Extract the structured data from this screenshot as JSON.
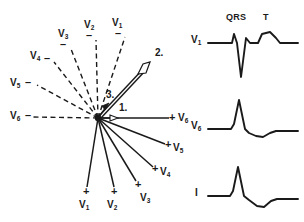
{
  "figure": {
    "stroke_color": "#1a1a1a",
    "background": "#ffffff"
  },
  "vector_diagram": {
    "origin": {
      "x": 98,
      "y": 118
    },
    "negative_axes": [
      {
        "lead": "V",
        "index": "1",
        "sign": "–",
        "label_x": 118,
        "label_y": 22,
        "sign_x": 120,
        "sign_y": 33,
        "end_x": 124,
        "end_y": 38
      },
      {
        "lead": "V",
        "index": "2",
        "sign": "–",
        "label_x": 89,
        "label_y": 24,
        "sign_x": 91,
        "sign_y": 35,
        "end_x": 95,
        "end_y": 41
      },
      {
        "lead": "V",
        "index": "3",
        "sign": "–",
        "label_x": 62,
        "label_y": 33,
        "sign_x": 64,
        "sign_y": 44,
        "end_x": 71,
        "end_y": 50
      },
      {
        "lead": "V",
        "index": "4",
        "sign": "–",
        "label_x": 33,
        "label_y": 55,
        "sign_x": 48,
        "sign_y": 58,
        "end_x": 55,
        "end_y": 63
      },
      {
        "lead": "V",
        "index": "5",
        "sign": "–",
        "label_x": 13,
        "label_y": 82,
        "sign_x": 30,
        "sign_y": 82,
        "end_x": 38,
        "end_y": 86
      },
      {
        "lead": "V",
        "index": "6",
        "sign": "–",
        "label_x": 13,
        "label_y": 113,
        "sign_x": 29,
        "sign_y": 113,
        "end_x": 34,
        "end_y": 117
      }
    ],
    "positive_axes": [
      {
        "lead": "V",
        "index": "1",
        "sign": "+",
        "label_x": 82,
        "label_y": 205,
        "sign_x": 85,
        "sign_y": 190,
        "end_x": 86,
        "end_y": 186
      },
      {
        "lead": "V",
        "index": "2",
        "sign": "+",
        "label_x": 110,
        "label_y": 205,
        "sign_x": 113,
        "sign_y": 190,
        "end_x": 114,
        "end_y": 186
      },
      {
        "lead": "V",
        "index": "3",
        "sign": "+",
        "label_x": 143,
        "label_y": 198,
        "sign_x": 137,
        "sign_y": 183,
        "end_x": 136,
        "end_y": 180
      },
      {
        "lead": "V",
        "index": "4",
        "sign": "+",
        "label_x": 161,
        "label_y": 172,
        "sign_x": 154,
        "sign_y": 169,
        "end_x": 152,
        "end_y": 166
      },
      {
        "lead": "V",
        "index": "5",
        "sign": "+",
        "label_x": 175,
        "label_y": 148,
        "sign_x": 168,
        "sign_y": 146,
        "end_x": 165,
        "end_y": 143
      },
      {
        "lead": "V",
        "index": "6",
        "sign": "+",
        "label_x": 181,
        "label_y": 118,
        "sign_x": 171,
        "sign_y": 117,
        "end_x": 168,
        "end_y": 118
      }
    ],
    "vectors": [
      {
        "label": "1.",
        "label_x": 122,
        "label_y": 108,
        "end_x": 116,
        "end_y": 117,
        "description": "initial septal vector, short arrow pointing right"
      },
      {
        "label": "2.",
        "label_x": 158,
        "label_y": 53,
        "end_x": 147,
        "end_y": 66,
        "description": "main QRS vector, long arrow pointing up-right"
      },
      {
        "label": "3.",
        "label_x": 110,
        "label_y": 95,
        "end_x": 106,
        "end_y": 107,
        "description": "terminal vector, short arrow pointing up-right"
      }
    ]
  },
  "waveforms": [
    {
      "lead_label": "V",
      "lead_index": "1",
      "label_x": 194,
      "label_y": 39,
      "baseline_y": 43,
      "annotations": [
        {
          "text": "QRS",
          "x": 228,
          "y": 14
        },
        {
          "text": "T",
          "x": 264,
          "y": 14
        }
      ],
      "description": "small r wave, deep S wave, upright T wave"
    },
    {
      "lead_label": "V",
      "lead_index": "6",
      "label_x": 194,
      "label_y": 125,
      "baseline_y": 129,
      "annotations": [],
      "description": "tall R wave, small s wave, slightly inverted then upright T"
    },
    {
      "lead_label": "I",
      "lead_index": "",
      "label_x": 196,
      "label_y": 192,
      "baseline_y": 196,
      "annotations": [],
      "description": "tall R wave, small s wave, shallow negative T deflection"
    }
  ]
}
